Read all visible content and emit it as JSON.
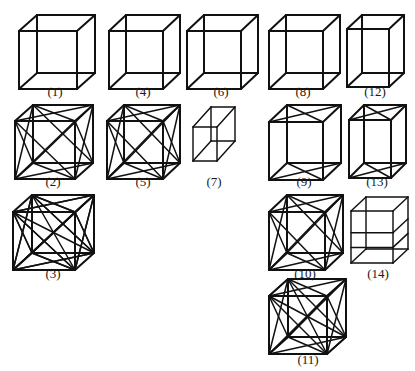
{
  "sheet": {
    "title": "Cube wireframe figure panel",
    "background_color": "#ffffff",
    "stroke_color": "#111111",
    "width": 415,
    "height": 363
  },
  "figures": [
    {
      "id": 1,
      "label": "(1)",
      "caption": "(1)",
      "kind": "cube-plain",
      "description": "Plain wireframe cube, all 12 edges, no diagonals",
      "x": 16,
      "y": 12,
      "w": 78,
      "h": 72,
      "box": {
        "fw": 58,
        "fh": 58,
        "dx": 18,
        "dy": -16
      },
      "diagonals": []
    },
    {
      "id": 4,
      "label": "(4)",
      "caption": "(4)",
      "kind": "cube-plain",
      "description": "Plain wireframe cube, all 12 edges, no diagonals",
      "x": 106,
      "y": 12,
      "w": 74,
      "h": 72,
      "box": {
        "fw": 54,
        "fh": 58,
        "dx": 17,
        "dy": -16
      },
      "diagonals": []
    },
    {
      "id": 6,
      "label": "(6)",
      "caption": "(6)",
      "kind": "cube-plain",
      "description": "Plain wireframe cube, all 12 edges, no diagonals",
      "x": 184,
      "y": 12,
      "w": 74,
      "h": 72,
      "box": {
        "fw": 54,
        "fh": 58,
        "dx": 17,
        "dy": -16
      },
      "diagonals": []
    },
    {
      "id": 8,
      "label": "(8)",
      "caption": "(8)",
      "kind": "cube-plain",
      "description": "Plain wireframe cube, all 12 edges, no diagonals",
      "x": 266,
      "y": 12,
      "w": 74,
      "h": 72,
      "box": {
        "fw": 54,
        "fh": 58,
        "dx": 17,
        "dy": -16
      },
      "diagonals": []
    },
    {
      "id": 12,
      "label": "(12)",
      "caption": "(12)",
      "kind": "cube-plain-tall",
      "description": "Narrow tall wireframe cube, all 12 edges, no diagonals",
      "x": 344,
      "y": 12,
      "w": 62,
      "h": 72,
      "box": {
        "fw": 42,
        "fh": 58,
        "dx": 15,
        "dy": -14
      },
      "diagonals": []
    },
    {
      "id": 2,
      "label": "(2)",
      "caption": "(2)",
      "kind": "cube-face-diagonals",
      "description": "Cube with face diagonals on front, back, left, right, top, bottom",
      "x": 12,
      "y": 102,
      "w": 82,
      "h": 72,
      "box": {
        "fw": 60,
        "fh": 58,
        "dx": 18,
        "dy": -16
      },
      "diagonals": [
        "front",
        "back",
        "left",
        "right",
        "top",
        "bottom"
      ]
    },
    {
      "id": 5,
      "label": "(5)",
      "caption": "(5)",
      "kind": "cube-face-diagonals",
      "description": "Cube with face diagonals on all six faces",
      "x": 104,
      "y": 102,
      "w": 78,
      "h": 72,
      "box": {
        "fw": 56,
        "fh": 58,
        "dx": 17,
        "dy": -16
      },
      "diagonals": [
        "front",
        "back",
        "left",
        "right",
        "top",
        "bottom"
      ]
    },
    {
      "id": 7,
      "label": "(7)",
      "caption": "(7)",
      "kind": "rhombohedron",
      "description": "Flattened squashed cube / rhombohedron, narrow",
      "x": 190,
      "y": 104,
      "w": 48,
      "h": 70,
      "box": {
        "fw": 24,
        "fh": 34,
        "dx": 18,
        "dy": -20
      },
      "diagonals": []
    },
    {
      "id": 9,
      "label": "(9)",
      "caption": "(9)",
      "kind": "cube-top-bottom-diagonals",
      "description": "Cube with diagonals only on top and bottom faces",
      "x": 266,
      "y": 102,
      "w": 76,
      "h": 72,
      "box": {
        "fw": 54,
        "fh": 58,
        "dx": 18,
        "dy": -17
      },
      "diagonals": [
        "top",
        "bottom"
      ]
    },
    {
      "id": 13,
      "label": "(13)",
      "caption": "(13)",
      "kind": "cube-top-bottom-diagonals-tall",
      "description": "Narrow tall cube with diagonals on top and bottom faces",
      "x": 346,
      "y": 102,
      "w": 62,
      "h": 72,
      "box": {
        "fw": 42,
        "fh": 58,
        "dx": 15,
        "dy": -15
      },
      "diagonals": [
        "top",
        "bottom"
      ]
    },
    {
      "id": 3,
      "label": "(3)",
      "caption": "(3)",
      "kind": "cube-dense",
      "description": "Cube with face diagonals plus many space diagonals, dense mesh",
      "x": 10,
      "y": 192,
      "w": 86,
      "h": 74,
      "box": {
        "fw": 62,
        "fh": 58,
        "dx": 19,
        "dy": -17
      },
      "diagonals": [
        "front",
        "back",
        "left",
        "right",
        "top",
        "bottom",
        "space"
      ]
    },
    {
      "id": 10,
      "label": "(10)",
      "caption": "(10)",
      "kind": "cube-face-diagonals",
      "description": "Cube with face diagonals on all six faces",
      "x": 266,
      "y": 192,
      "w": 78,
      "h": 74,
      "box": {
        "fw": 56,
        "fh": 58,
        "dx": 18,
        "dy": -17
      },
      "diagonals": [
        "front",
        "back",
        "left",
        "right",
        "top",
        "bottom"
      ]
    },
    {
      "id": 14,
      "label": "(14)",
      "caption": "(14)",
      "kind": "cube-horizontal-bands",
      "description": "Cube with two horizontal cross-section bands, no diagonals",
      "x": 348,
      "y": 194,
      "w": 60,
      "h": 72,
      "box": {
        "fw": 42,
        "fh": 52,
        "dx": 15,
        "dy": -14
      },
      "diagonals": []
    },
    {
      "id": 11,
      "label": "(11)",
      "caption": "(11)",
      "kind": "cube-complete-graph",
      "description": "Cube with all vertex pairs connected, complete graph K8",
      "x": 266,
      "y": 276,
      "w": 84,
      "h": 76,
      "box": {
        "fw": 58,
        "fh": 58,
        "dx": 19,
        "dy": -17
      },
      "diagonals": [
        "front",
        "back",
        "left",
        "right",
        "top",
        "bottom",
        "space"
      ]
    }
  ]
}
